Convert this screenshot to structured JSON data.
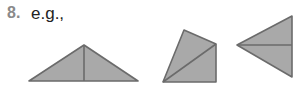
{
  "question": {
    "number": "8.",
    "text": "e.g.,"
  },
  "colors": {
    "shape_fill": "#a9a9a9",
    "shape_stroke": "#6b6b6b",
    "number": "#8a8a8a",
    "text": "#222222"
  },
  "shapes": [
    {
      "name": "wide-isosceles-triangle",
      "description": "Wide isosceles triangle split by a vertical line from apex to base",
      "outline": [
        [
          29,
          81
        ],
        [
          84,
          45
        ],
        [
          138,
          81
        ]
      ],
      "divider": [
        [
          84,
          45
        ],
        [
          84,
          81
        ]
      ]
    },
    {
      "name": "quadrilateral-with-diagonal",
      "description": "Quadrilateral split by a diagonal into two triangles",
      "outline": [
        [
          163,
          82
        ],
        [
          184,
          30
        ],
        [
          216,
          44
        ],
        [
          216,
          82
        ]
      ],
      "divider": [
        [
          163,
          82
        ],
        [
          216,
          44
        ]
      ]
    },
    {
      "name": "left-pointing-triangle",
      "description": "Triangle pointing left, split by a horizontal line from vertex to right side",
      "outline": [
        [
          237,
          45
        ],
        [
          292,
          16
        ],
        [
          292,
          77
        ]
      ],
      "divider": [
        [
          237,
          45
        ],
        [
          292,
          45
        ]
      ]
    }
  ]
}
